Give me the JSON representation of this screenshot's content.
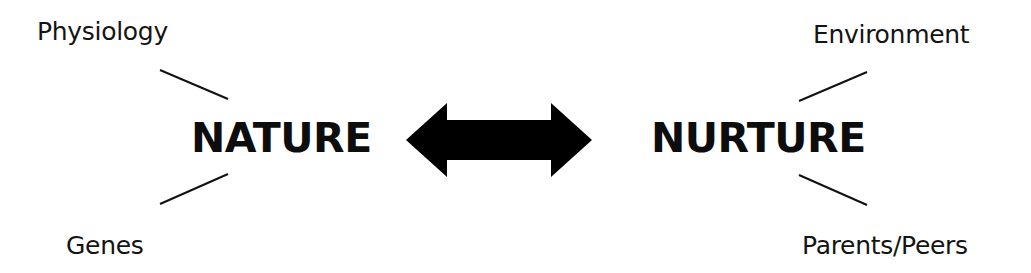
{
  "diagram": {
    "left_concept": {
      "label": "NATURE",
      "factors": [
        "Physiology",
        "Genes"
      ]
    },
    "right_concept": {
      "label": "NURTURE",
      "factors": [
        "Environment",
        "Parents/Peers"
      ]
    },
    "connector": "double-headed-arrow",
    "colors": {
      "background": "#ffffff",
      "ink": "#000000"
    }
  }
}
